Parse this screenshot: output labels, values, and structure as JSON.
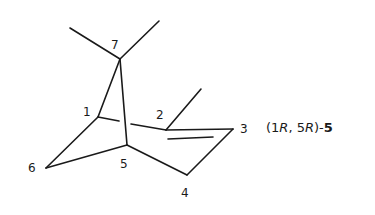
{
  "diagram": {
    "type": "chemical-structure",
    "atoms": [
      {
        "label": "1",
        "x": 98,
        "y": 117,
        "label_x": 83,
        "label_y": 116
      },
      {
        "label": "2",
        "x": 166,
        "y": 130,
        "label_x": 156,
        "label_y": 119
      },
      {
        "label": "3",
        "x": 233,
        "y": 129,
        "label_x": 240,
        "label_y": 133
      },
      {
        "label": "4",
        "x": 187,
        "y": 175,
        "label_x": 181,
        "label_y": 197
      },
      {
        "label": "5",
        "x": 127,
        "y": 145,
        "label_x": 120,
        "label_y": 168
      },
      {
        "label": "6",
        "x": 46,
        "y": 168,
        "label_x": 28,
        "label_y": 172
      },
      {
        "label": "7",
        "x": 120,
        "y": 59,
        "label_x": 111,
        "label_y": 49
      }
    ],
    "caption": {
      "prefix": "(1",
      "r1": "R",
      "mid": ", 5",
      "r2": "R",
      "suffix": ")-",
      "compound_number": "5"
    }
  }
}
